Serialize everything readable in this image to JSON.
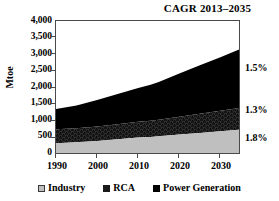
{
  "chart_data": {
    "type": "area",
    "title": "CAGR 2013–2035",
    "xlabel": "",
    "ylabel": "Mtoe",
    "xlim": [
      1990,
      2035
    ],
    "ylim": [
      0,
      4000
    ],
    "y_ticks": [
      "0",
      "500",
      "1,000",
      "1,500",
      "2,000",
      "2,500",
      "3,000",
      "3,500",
      "4,000"
    ],
    "y_tick_values": [
      0,
      500,
      1000,
      1500,
      2000,
      2500,
      3000,
      3500,
      4000
    ],
    "x_ticks": [
      "1990",
      "2000",
      "2010",
      "2020",
      "2030"
    ],
    "x_tick_values": [
      1990,
      2000,
      2010,
      2020,
      2030
    ],
    "grid": false,
    "stacked": true,
    "legend_position": "bottom",
    "x": [
      1990,
      1995,
      2000,
      2005,
      2010,
      2013,
      2015,
      2020,
      2025,
      2030,
      2035
    ],
    "series": [
      {
        "name": "Industry",
        "color": "#bfbfbf",
        "cagr": "1.8%",
        "values": [
          350,
          380,
          420,
          470,
          520,
          540,
          560,
          610,
          660,
          710,
          760
        ]
      },
      {
        "name": "RCA",
        "color": "#1a1a1a",
        "pattern": "dark-textured",
        "cagr": "1.3%",
        "values": [
          420,
          420,
          430,
          450,
          470,
          480,
          490,
          530,
          570,
          610,
          650
        ]
      },
      {
        "name": "Power Generation",
        "color": "#000000",
        "cagr": "1.5%",
        "values": [
          600,
          680,
          790,
          900,
          1010,
          1080,
          1130,
          1290,
          1450,
          1600,
          1760
        ]
      }
    ],
    "stack_totals": [
      1370,
      1480,
      1640,
      1820,
      2000,
      2100,
      2180,
      2430,
      2680,
      2920,
      3170
    ],
    "annotations": [
      {
        "text": "1.5%",
        "series": "Power Generation"
      },
      {
        "text": "1.3%",
        "series": "RCA"
      },
      {
        "text": "1.8%",
        "series": "Industry"
      }
    ]
  },
  "legend": {
    "items": [
      {
        "label": "Industry",
        "swatch_color": "#bfbfbf"
      },
      {
        "label": "RCA",
        "swatch_color": "#1a1a1a"
      },
      {
        "label": "Power Generation",
        "swatch_color": "#000000"
      }
    ]
  },
  "colors": {
    "industry": "#bfbfbf",
    "rca": "#1a1a1a",
    "power_generation": "#000000",
    "axis": "#4a4a4a",
    "text": "#000000",
    "background": "#ffffff"
  }
}
